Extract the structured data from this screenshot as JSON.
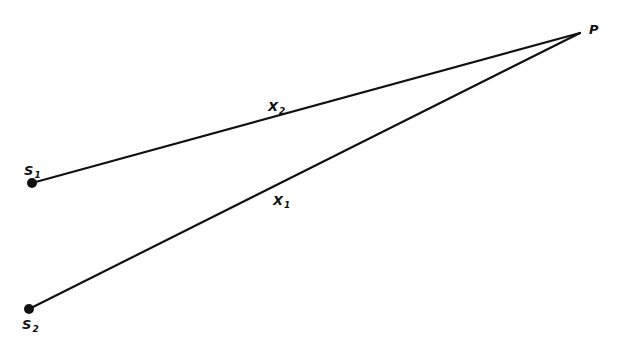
{
  "diagram": {
    "points": {
      "S1": {
        "label": "S",
        "subscript": "1",
        "x": 32,
        "y": 183
      },
      "S2": {
        "label": "S",
        "subscript": "2",
        "x": 29,
        "y": 309
      },
      "P": {
        "label": "P",
        "x": 580,
        "y": 33
      }
    },
    "segments": [
      {
        "from": "S1",
        "to": "P",
        "label": "X",
        "subscript": "2"
      },
      {
        "from": "S2",
        "to": "P",
        "label": "X",
        "subscript": "1"
      }
    ],
    "colors": {
      "ink": "#111111",
      "background": "#ffffff"
    }
  }
}
